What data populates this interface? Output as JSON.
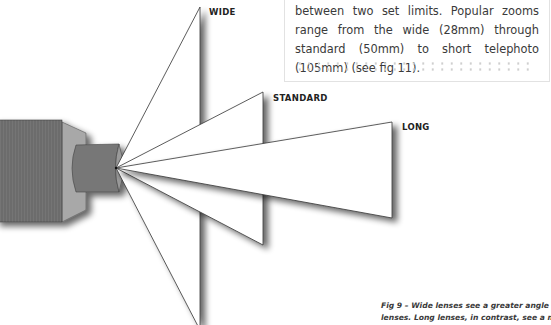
{
  "textbox": {
    "text": "between two set limits. Popular zooms range from the wide (28mm) through standard (50mm) to short telephoto (105mm) (see fig 11)."
  },
  "labels": {
    "wide": "WIDE",
    "standard": "STANDARD",
    "long": "LONG"
  },
  "caption": {
    "line1": "Fig 9 – Wide lenses see a greater angle of view than standard",
    "line2": "lenses. Long lenses, in contrast, see a much more restricted view."
  },
  "colors": {
    "camera_body": "#6e6e6e",
    "camera_side": "#a9a9a9",
    "lens_barrel": "#7a7a7a",
    "outline": "#333333",
    "text": "#3a3a3a",
    "label": "#222222"
  }
}
